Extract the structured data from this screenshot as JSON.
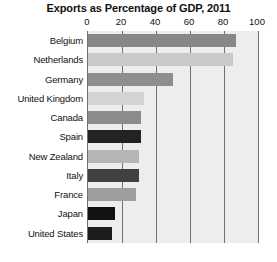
{
  "chart_data": {
    "type": "bar",
    "orientation": "horizontal",
    "title": "Exports as Percentage of GDP, 2011",
    "xlabel": "",
    "ylabel": "",
    "xlim": [
      0,
      100
    ],
    "xticks": [
      0,
      20,
      40,
      60,
      80,
      100
    ],
    "xtick_labels": [
      "0",
      "20",
      "40",
      "60",
      "80",
      "100"
    ],
    "grid": true,
    "gridlines_at": [
      20,
      40,
      60,
      80,
      100
    ],
    "legend": "none",
    "plot_background": "#eceded",
    "axis_color": "#6f7072",
    "categories": [
      "Belgium",
      "Netherlands",
      "Germany",
      "United Kingdom",
      "Canada",
      "Spain",
      "New Zealand",
      "Italy",
      "France",
      "Japan",
      "United States"
    ],
    "values": [
      87,
      85,
      50,
      33,
      31,
      31,
      30,
      30,
      28,
      16,
      14
    ],
    "bar_colors": [
      "#878787",
      "#c9c9c9",
      "#8e8e8e",
      "#d3d4d4",
      "#8b8c8c",
      "#232323",
      "#b4b5b5",
      "#3f4040",
      "#9d9e9e",
      "#121212",
      "#1d1d1d"
    ]
  }
}
